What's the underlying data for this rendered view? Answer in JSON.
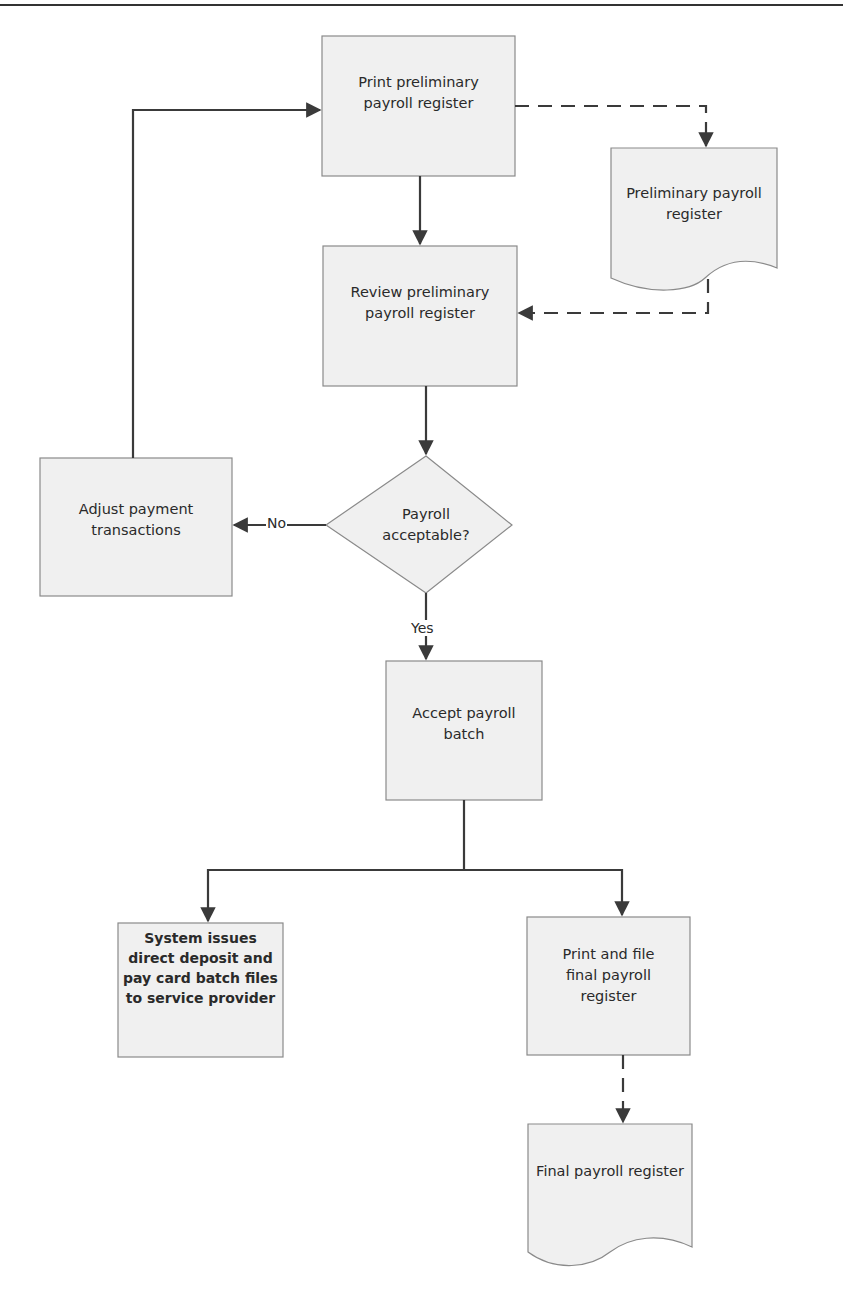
{
  "diagram": {
    "type": "flowchart",
    "colors": {
      "box_fill": "#f0f0f0",
      "box_stroke": "#8a8a8a",
      "line": "#3a3a3a"
    },
    "nodes": {
      "print_prelim": {
        "label": "Print preliminary payroll register",
        "shape": "process"
      },
      "prelim_doc": {
        "label": "Preliminary payroll register",
        "shape": "document"
      },
      "review_prelim": {
        "label": "Review preliminary payroll register",
        "shape": "process"
      },
      "decision": {
        "label": "Payroll acceptable?",
        "shape": "decision"
      },
      "adjust": {
        "label": "Adjust payment transactions",
        "shape": "process"
      },
      "accept": {
        "label": "Accept payroll batch",
        "shape": "process"
      },
      "system_issues": {
        "label": "System issues direct deposit and pay card batch files to service provider",
        "shape": "process"
      },
      "print_final": {
        "label": "Print and file final payroll register",
        "shape": "process"
      },
      "final_doc": {
        "label": "Final payroll register",
        "shape": "document"
      }
    },
    "edge_labels": {
      "no": "No",
      "yes": "Yes"
    },
    "edges": [
      {
        "from": "print_prelim",
        "to": "prelim_doc",
        "style": "dashed"
      },
      {
        "from": "print_prelim",
        "to": "review_prelim",
        "style": "solid"
      },
      {
        "from": "prelim_doc",
        "to": "review_prelim",
        "style": "dashed"
      },
      {
        "from": "review_prelim",
        "to": "decision",
        "style": "solid"
      },
      {
        "from": "decision",
        "to": "adjust",
        "style": "solid",
        "label": "No"
      },
      {
        "from": "adjust",
        "to": "print_prelim",
        "style": "solid"
      },
      {
        "from": "decision",
        "to": "accept",
        "style": "solid",
        "label": "Yes"
      },
      {
        "from": "accept",
        "to": "system_issues",
        "style": "solid"
      },
      {
        "from": "accept",
        "to": "print_final",
        "style": "solid"
      },
      {
        "from": "print_final",
        "to": "final_doc",
        "style": "dashed"
      }
    ]
  }
}
